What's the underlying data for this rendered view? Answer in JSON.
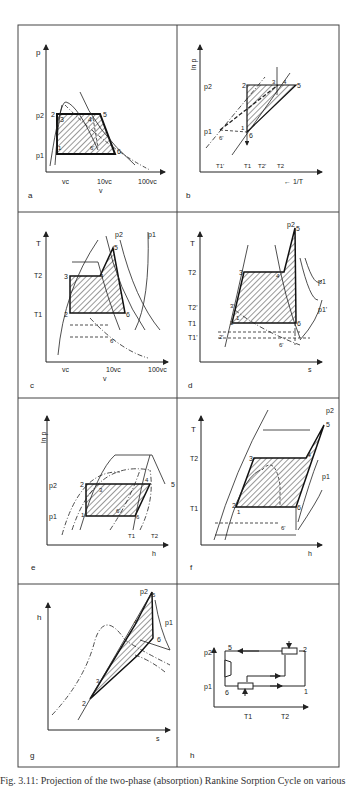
{
  "figure": {
    "caption": "Fig. 3.11: Projection of the two-phase (absorption) Rankine Sorption Cycle on various",
    "line_color": "#333333",
    "hatch_color": "#444444"
  },
  "panels": {
    "a": {
      "label": "a",
      "y_axis": "p",
      "x_axis": "v",
      "y_ticks": [
        "p2",
        "p1"
      ],
      "x_ticks": [
        "vc",
        "10vc",
        "100vc"
      ],
      "points": [
        "1",
        "2",
        "3",
        "4",
        "5",
        "6",
        "6'"
      ]
    },
    "b": {
      "label": "b",
      "y_axis": "ln p",
      "x_axis": "← 1/T",
      "y_ticks": [
        "p2",
        "p1"
      ],
      "x_ticks": [
        "T1'",
        "T1",
        "T2'",
        "T2"
      ],
      "points": [
        "1",
        "2",
        "3",
        "4",
        "5",
        "6",
        "6'"
      ]
    },
    "c": {
      "label": "c",
      "y_axis": "T",
      "x_axis": "v",
      "y_ticks": [
        "T2",
        "T1"
      ],
      "x_ticks": [
        "vc",
        "10vc",
        "100vc"
      ],
      "curve_labels": [
        "p2",
        "p1"
      ],
      "points": [
        "2",
        "3",
        "4",
        "5",
        "6",
        "6'"
      ]
    },
    "d": {
      "label": "d",
      "y_axis": "T",
      "x_axis": "s",
      "y_ticks": [
        "T2",
        "T2'",
        "T1",
        "T1'"
      ],
      "curve_labels": [
        "p2",
        "p1",
        "p1'"
      ],
      "points": [
        "1",
        "2",
        "2'",
        "3",
        "3'",
        "4",
        "5",
        "6",
        "6'"
      ]
    },
    "e": {
      "label": "e",
      "y_axis": "ln p",
      "x_axis": "h",
      "y_ticks": [
        "p2",
        "p1"
      ],
      "curve_labels": [
        "T1",
        "T2"
      ],
      "points": [
        "1",
        "2",
        "3",
        "4",
        "5",
        "6",
        "6'"
      ]
    },
    "f": {
      "label": "f",
      "y_axis": "T",
      "x_axis": "h",
      "y_ticks": [
        "T2",
        "T1"
      ],
      "curve_labels": [
        "p2",
        "p1"
      ],
      "points": [
        "1",
        "2",
        "3",
        "4",
        "5",
        "6",
        "6'"
      ]
    },
    "g": {
      "label": "g",
      "y_axis": "h",
      "x_axis": "s",
      "curve_labels": [
        "p2",
        "p1"
      ],
      "points": [
        "2",
        "3",
        "4",
        "5",
        "6"
      ]
    },
    "h": {
      "label": "h",
      "y_ticks": [
        "p2",
        "p1"
      ],
      "x_ticks": [
        "T1",
        "T2"
      ],
      "points": [
        "1",
        "2",
        "5",
        "6"
      ]
    }
  }
}
